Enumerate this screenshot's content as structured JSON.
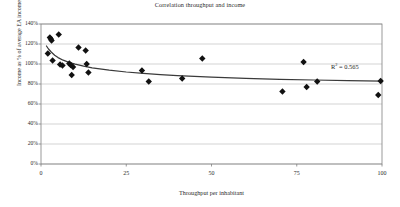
{
  "chart_data": {
    "type": "scatter",
    "title": "Correlation throughput and income",
    "xlabel": "Throughput per inhabitant",
    "ylabel": "Income as % of average EA income",
    "xlim": [
      0,
      100
    ],
    "ylim": [
      0,
      140
    ],
    "xticks": [
      0,
      25,
      50,
      75,
      100
    ],
    "yticks": [
      0,
      20,
      40,
      60,
      80,
      100,
      120,
      140
    ],
    "ytick_labels": [
      "0%",
      "20%",
      "40%",
      "60%",
      "80%",
      "100%",
      "120%",
      "140%"
    ],
    "xtick_labels": [
      "0",
      "25",
      "50",
      "75",
      "100"
    ],
    "grid": "horizontal",
    "legend": "none",
    "annotations": [
      {
        "name": "r-squared",
        "prefix": "R",
        "superscript": "2",
        "suffix": " = 0.565",
        "text": "R² = 0.565",
        "value": 0.565
      }
    ],
    "marker": {
      "shape": "diamond",
      "color": "#111111",
      "size": 3.2
    },
    "series": [
      {
        "name": "Countries",
        "points": [
          {
            "x": 2.0,
            "y": 110.5
          },
          {
            "x": 2.6,
            "y": 126.5
          },
          {
            "x": 2.9,
            "y": 125.0
          },
          {
            "x": 3.1,
            "y": 123.5
          },
          {
            "x": 3.4,
            "y": 103.5
          },
          {
            "x": 5.2,
            "y": 129.5
          },
          {
            "x": 5.6,
            "y": 99.5
          },
          {
            "x": 6.3,
            "y": 98.5
          },
          {
            "x": 8.3,
            "y": 100.5
          },
          {
            "x": 8.7,
            "y": 99.0
          },
          {
            "x": 9.0,
            "y": 89.0
          },
          {
            "x": 9.4,
            "y": 97.0
          },
          {
            "x": 11.0,
            "y": 116.5
          },
          {
            "x": 13.1,
            "y": 113.5
          },
          {
            "x": 13.4,
            "y": 100.0
          },
          {
            "x": 13.9,
            "y": 91.5
          },
          {
            "x": 29.6,
            "y": 93.5
          },
          {
            "x": 31.6,
            "y": 82.5
          },
          {
            "x": 41.4,
            "y": 85.5
          },
          {
            "x": 47.3,
            "y": 105.5
          },
          {
            "x": 70.8,
            "y": 72.5
          },
          {
            "x": 77.0,
            "y": 102.0
          },
          {
            "x": 77.9,
            "y": 77.0
          },
          {
            "x": 81.0,
            "y": 82.5
          },
          {
            "x": 98.9,
            "y": 69.0
          },
          {
            "x": 99.6,
            "y": 83.0
          }
        ]
      }
    ],
    "trendline": {
      "type": "power",
      "color": "#3a3a3a",
      "description": "decreasing power/logarithmic fit from about 118% at x=2 to about 83% at x=100",
      "points": [
        {
          "x": 1.6,
          "y": 118.0
        },
        {
          "x": 2.2,
          "y": 115.0
        },
        {
          "x": 3.0,
          "y": 112.0
        },
        {
          "x": 4.0,
          "y": 108.8
        },
        {
          "x": 5.0,
          "y": 106.4
        },
        {
          "x": 6.5,
          "y": 103.8
        },
        {
          "x": 8.0,
          "y": 101.8
        },
        {
          "x": 10.0,
          "y": 99.8
        },
        {
          "x": 12.5,
          "y": 97.8
        },
        {
          "x": 15.0,
          "y": 96.2
        },
        {
          "x": 20.0,
          "y": 93.8
        },
        {
          "x": 25.0,
          "y": 92.0
        },
        {
          "x": 30.0,
          "y": 90.6
        },
        {
          "x": 35.0,
          "y": 89.4
        },
        {
          "x": 40.0,
          "y": 88.4
        },
        {
          "x": 50.0,
          "y": 86.8
        },
        {
          "x": 60.0,
          "y": 85.6
        },
        {
          "x": 70.0,
          "y": 84.7
        },
        {
          "x": 80.0,
          "y": 84.0
        },
        {
          "x": 90.0,
          "y": 83.4
        },
        {
          "x": 100.0,
          "y": 82.9
        }
      ]
    },
    "style": {
      "plot_border_color": "#808080",
      "gridline_color": "#b5b5b5",
      "background": "#ffffff"
    }
  }
}
